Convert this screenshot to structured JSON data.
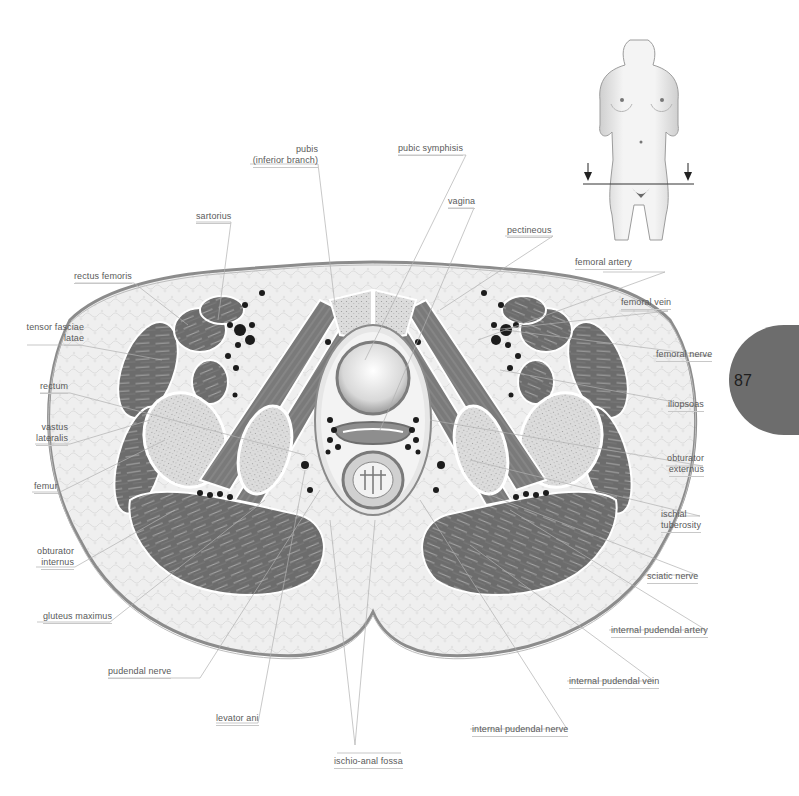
{
  "page": {
    "number": "87",
    "tab_color": "#6d6d6d"
  },
  "figure": {
    "type": "anatomical cross-section (female pelvis, transverse)",
    "locator_figure": "female torso with horizontal section line and two downward arrows",
    "colors": {
      "muscle": "#6f6f6f",
      "muscle_light": "#8a8a8a",
      "fat": "#ececec",
      "bone": "#d6d6d6",
      "skin_outline": "#8c8c8c",
      "vessel": "#1c1c1c",
      "leader_line": "#b0b0b0"
    }
  },
  "labels": {
    "left": [
      {
        "id": "sartorius",
        "text": "sartorius"
      },
      {
        "id": "rectus_femoris",
        "text": "rectus femoris"
      },
      {
        "id": "tensor_fasciae_latae",
        "line1": "tensor fasciae",
        "line2": "latae"
      },
      {
        "id": "rectum",
        "text": "rectum"
      },
      {
        "id": "vastus_lateralis",
        "line1": "vastus",
        "line2": "lateralis"
      },
      {
        "id": "femur",
        "text": "femur"
      },
      {
        "id": "obturator_internus",
        "line1": "obturator",
        "line2": "internus"
      },
      {
        "id": "gluteus_maximus",
        "text": "gluteus maximus"
      },
      {
        "id": "pudendal_nerve",
        "text": "pudendal nerve"
      },
      {
        "id": "levator_ani",
        "text": "levator ani"
      }
    ],
    "top": [
      {
        "id": "pubis",
        "line1": "pubis",
        "line2": "(inferior branch)"
      },
      {
        "id": "pubic_symphisis",
        "text": "pubic symphisis"
      },
      {
        "id": "vagina",
        "text": "vagina"
      },
      {
        "id": "pectineous",
        "text": "pectineous"
      }
    ],
    "right": [
      {
        "id": "femoral_artery",
        "text": "femoral artery"
      },
      {
        "id": "femoral_vein",
        "text": "femoral vein"
      },
      {
        "id": "femoral_nerve",
        "text": "femoral nerve"
      },
      {
        "id": "iliopsoas",
        "text": "iliopsoas"
      },
      {
        "id": "obturator_externus",
        "line1": "obturator",
        "line2": "externus"
      },
      {
        "id": "ischial_tuberosity",
        "line1": "ischial",
        "line2": "tuberosity"
      },
      {
        "id": "sciatic_nerve",
        "text": "sciatic nerve"
      },
      {
        "id": "internal_pudendal_artery",
        "text": "internal pudendal artery"
      },
      {
        "id": "internal_pudendal_vein",
        "text": "internal pudendal vein"
      },
      {
        "id": "internal_pudendal_nerve",
        "text": "internal pudendal nerve"
      }
    ],
    "bottom": [
      {
        "id": "ischio_anal_fossa",
        "text": "ischio-anal fossa"
      }
    ]
  }
}
